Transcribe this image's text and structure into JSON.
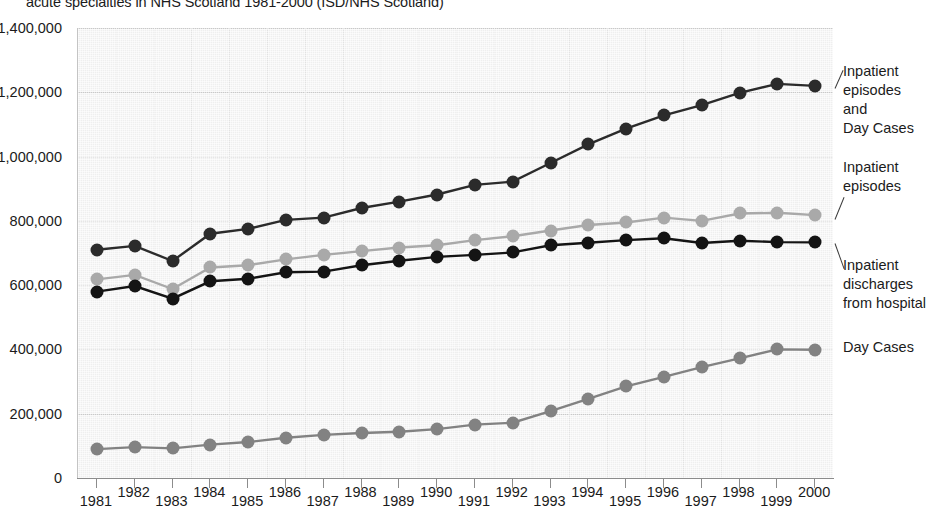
{
  "title": "acute specialties in NHS Scotland 1981-2000 (ISD/NHS Scotland)",
  "axes": {
    "y_ticks": [
      "1,400,000",
      "1,200,000",
      "1,000,000",
      "800,000",
      "600,000",
      "400,000",
      "200,000",
      "0"
    ],
    "x_ticks": [
      "1981",
      "1982",
      "1983",
      "1984",
      "1985",
      "1986",
      "1987",
      "1988",
      "1989",
      "1990",
      "1991",
      "1992",
      "1993",
      "1994",
      "1995",
      "1996",
      "1997",
      "1998",
      "1999",
      "2000"
    ]
  },
  "legend": {
    "items": [
      {
        "label": "Inpatient\nepisodes and\nDay Cases",
        "color": "#2b2b2b"
      },
      {
        "label": "Inpatient\nepisodes",
        "color": "#a9a9a9"
      },
      {
        "label": "Inpatient\ndischarges\nfrom hospital",
        "color": "#141414"
      },
      {
        "label": "Day Cases",
        "color": "#828282"
      }
    ]
  },
  "colors": {
    "plot_background": "#efefef",
    "gridline": "#c9c9c9",
    "axis": "#8c8c8c",
    "text": "#1b1b1b"
  },
  "chart_data": {
    "type": "line",
    "title": "acute specialties in NHS Scotland 1981-2000 (ISD/NHS Scotland)",
    "xlabel": "",
    "ylabel": "",
    "ylim": [
      0,
      1400000
    ],
    "ytick_step": 200000,
    "grid": true,
    "legend_position": "right-annotations",
    "x": [
      1981,
      1982,
      1983,
      1984,
      1985,
      1986,
      1987,
      1988,
      1989,
      1990,
      1991,
      1992,
      1993,
      1994,
      1995,
      1996,
      1997,
      1998,
      1999,
      2000
    ],
    "categories": [
      "1981",
      "1982",
      "1983",
      "1984",
      "1985",
      "1986",
      "1987",
      "1988",
      "1989",
      "1990",
      "1991",
      "1992",
      "1993",
      "1994",
      "1995",
      "1996",
      "1997",
      "1998",
      "1999",
      "2000"
    ],
    "series": [
      {
        "name": "Inpatient episodes and Day Cases",
        "color": "#2b2b2b",
        "values": [
          710000,
          722000,
          675000,
          760000,
          775000,
          803000,
          810000,
          840000,
          860000,
          882000,
          912000,
          922000,
          980000,
          1038000,
          1087000,
          1128000,
          1160000,
          1198000,
          1226000,
          1220000
        ]
      },
      {
        "name": "Inpatient episodes",
        "color": "#a9a9a9",
        "values": [
          618000,
          632000,
          588000,
          655000,
          662000,
          680000,
          694000,
          706000,
          717000,
          724000,
          740000,
          752000,
          770000,
          787000,
          795000,
          810000,
          800000,
          823000,
          825000,
          818000
        ]
      },
      {
        "name": "Inpatient discharges from hospital",
        "color": "#141414",
        "values": [
          580000,
          597000,
          558000,
          612000,
          620000,
          640000,
          642000,
          662000,
          676000,
          688000,
          694000,
          702000,
          724000,
          732000,
          740000,
          746000,
          731000,
          738000,
          734000,
          733000
        ]
      },
      {
        "name": "Day Cases",
        "color": "#828282",
        "values": [
          90000,
          96000,
          92000,
          104000,
          112000,
          125000,
          134000,
          140000,
          144000,
          152000,
          166000,
          172000,
          208000,
          246000,
          285000,
          315000,
          345000,
          372000,
          400000,
          399000
        ]
      }
    ]
  }
}
